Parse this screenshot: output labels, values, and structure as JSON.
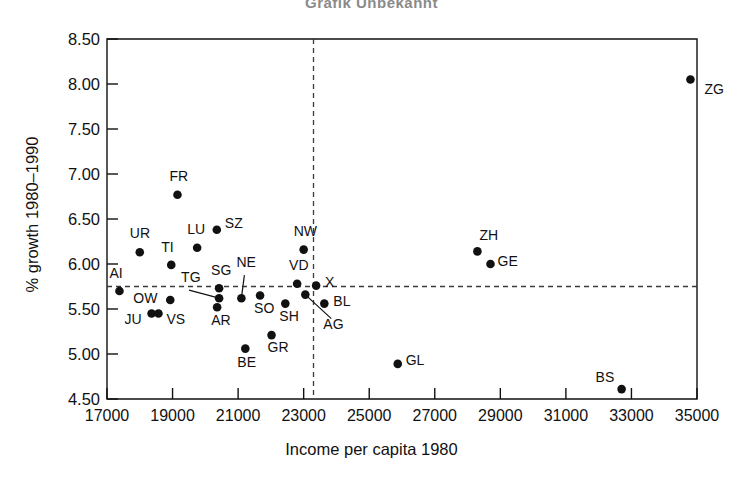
{
  "chart_data": {
    "type": "scatter",
    "title": "Grafik  Unbekannt",
    "xlabel": "Income per capita 1980",
    "ylabel": "% growth 1980–1990",
    "xlim": [
      17000,
      35000
    ],
    "ylim": [
      4.5,
      8.5
    ],
    "xticks": [
      17000,
      19000,
      21000,
      23000,
      25000,
      27000,
      29000,
      31000,
      33000,
      35000
    ],
    "xtick_labels": [
      "17000",
      "19000",
      "21000",
      "23000",
      "25000",
      "27000",
      "29000",
      "31000",
      "33000",
      "35000"
    ],
    "yticks": [
      4.5,
      5.0,
      5.5,
      6.0,
      6.5,
      7.0,
      7.5,
      8.0,
      8.5
    ],
    "ytick_labels": [
      "4.50",
      "5.00",
      "5.50",
      "6.00",
      "6.50",
      "7.00",
      "7.50",
      "8.00",
      "8.50"
    ],
    "grid": false,
    "legend": "none",
    "reference_lines": [
      {
        "name": "mean-income-vline",
        "orientation": "vertical",
        "value": 23300,
        "style": "dashed"
      },
      {
        "name": "mean-growth-hline",
        "orientation": "horizontal",
        "value": 5.75,
        "style": "dashed"
      }
    ],
    "points": [
      {
        "label": "ZG",
        "x": 34800,
        "y": 8.05,
        "lx": 14,
        "ly": 8,
        "leader": false
      },
      {
        "label": "ZH",
        "x": 28300,
        "y": 6.14,
        "lx": 2,
        "ly": -17,
        "leader": false
      },
      {
        "label": "GE",
        "x": 28700,
        "y": 6.0,
        "lx": 7,
        "ly": -4,
        "leader": false
      },
      {
        "label": "FR",
        "x": 19150,
        "y": 6.77,
        "lx": -8,
        "ly": -20,
        "leader": false
      },
      {
        "label": "SZ",
        "x": 20350,
        "y": 6.38,
        "lx": 8,
        "ly": -8,
        "leader": false
      },
      {
        "label": "NW",
        "x": 23000,
        "y": 6.16,
        "lx": -10,
        "ly": -20,
        "leader": false
      },
      {
        "label": "LU",
        "x": 19750,
        "y": 6.18,
        "lx": -10,
        "ly": -20,
        "leader": false
      },
      {
        "label": "UR",
        "x": 18000,
        "y": 6.13,
        "lx": -10,
        "ly": -20,
        "leader": false
      },
      {
        "label": "TI",
        "x": 18960,
        "y": 5.99,
        "lx": -10,
        "ly": -19,
        "leader": false
      },
      {
        "label": "AI",
        "x": 17380,
        "y": 5.7,
        "lx": -10,
        "ly": -19,
        "leader": false
      },
      {
        "label": "VD",
        "x": 22800,
        "y": 5.78,
        "lx": -8,
        "ly": -20,
        "leader": false
      },
      {
        "label": "X",
        "x": 23380,
        "y": 5.76,
        "lx": 9,
        "ly": -5,
        "leader": false
      },
      {
        "label": "SG",
        "x": 20420,
        "y": 5.73,
        "lx": -8,
        "ly": -19,
        "leader": false
      },
      {
        "label": "NE",
        "x": 21100,
        "y": 5.62,
        "lx": -5,
        "ly": -37,
        "leader": true
      },
      {
        "label": "TG",
        "x": 20420,
        "y": 5.62,
        "lx": -38,
        "ly": -22,
        "leader": true
      },
      {
        "label": "OW",
        "x": 18930,
        "y": 5.6,
        "lx": -37,
        "ly": -3,
        "leader": false
      },
      {
        "label": "SO",
        "x": 21670,
        "y": 5.65,
        "lx": -6,
        "ly": 11,
        "leader": false
      },
      {
        "label": "AR",
        "x": 20360,
        "y": 5.52,
        "lx": -6,
        "ly": 12,
        "leader": false
      },
      {
        "label": "JU",
        "x": 18360,
        "y": 5.45,
        "lx": -27,
        "ly": 4,
        "leader": false
      },
      {
        "label": "VS",
        "x": 18570,
        "y": 5.45,
        "lx": 8,
        "ly": 4,
        "leader": false
      },
      {
        "label": "SH",
        "x": 22440,
        "y": 5.56,
        "lx": -6,
        "ly": 11,
        "leader": false
      },
      {
        "label": "AG",
        "x": 23050,
        "y": 5.66,
        "lx": 18,
        "ly": 28,
        "leader": true
      },
      {
        "label": "BL",
        "x": 23630,
        "y": 5.56,
        "lx": 9,
        "ly": -4,
        "leader": false
      },
      {
        "label": "GR",
        "x": 22020,
        "y": 5.21,
        "lx": -4,
        "ly": 11,
        "leader": false
      },
      {
        "label": "BE",
        "x": 21220,
        "y": 5.06,
        "lx": -8,
        "ly": 12,
        "leader": false
      },
      {
        "label": "GL",
        "x": 25870,
        "y": 4.89,
        "lx": 8,
        "ly": -5,
        "leader": false
      },
      {
        "label": "BS",
        "x": 32700,
        "y": 4.61,
        "lx": -26,
        "ly": -13,
        "leader": false
      }
    ]
  }
}
